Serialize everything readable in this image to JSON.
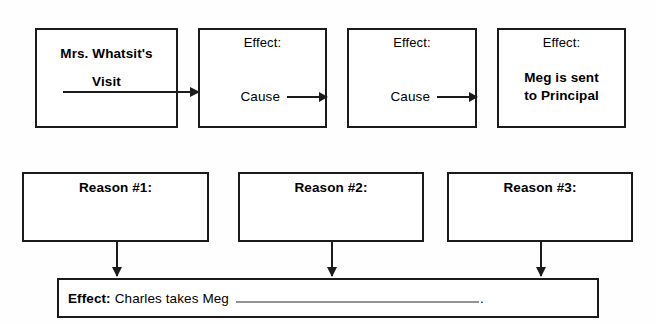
{
  "worksheet": {
    "title": "Cause and Effect Chain Worksheet",
    "background_color": "#fefefe",
    "line_color": "#1b1b1b"
  },
  "chain": {
    "boxes": [
      {
        "id": "chain-box-1",
        "effect_label": "",
        "title": "Mrs. Whatsit's",
        "title_line2": "Visit",
        "cause_label": ""
      },
      {
        "id": "chain-box-2",
        "effect_label": "Effect:",
        "title": "",
        "title_line2": "",
        "cause_label": "Cause"
      },
      {
        "id": "chain-box-3",
        "effect_label": "Effect:",
        "title": "",
        "title_line2": "",
        "cause_label": "Cause"
      },
      {
        "id": "chain-box-4",
        "effect_label": "Effect:",
        "title": "Meg is sent",
        "title_line2": "to Principal",
        "cause_label": ""
      }
    ]
  },
  "reasons": {
    "boxes": [
      {
        "id": "reason-box-1",
        "label": "Reason #1:",
        "value": ""
      },
      {
        "id": "reason-box-2",
        "label": "Reason #2:",
        "value": ""
      },
      {
        "id": "reason-box-3",
        "label": "Reason #3:",
        "value": ""
      }
    ]
  },
  "effect_bar": {
    "key": "Effect:",
    "value": "Charles takes Meg",
    "blank_answer": "",
    "period": "."
  }
}
